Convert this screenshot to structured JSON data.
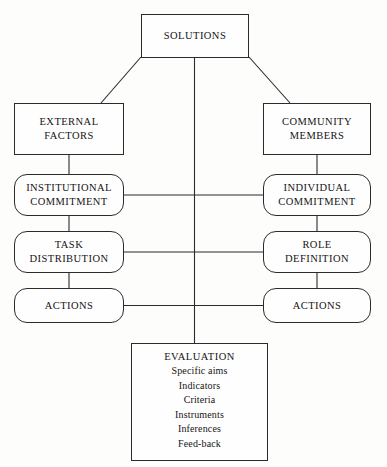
{
  "diagram": {
    "stroke_color": "#2b2b2b",
    "background_color": "#fdfdfc",
    "text_color": "#141414",
    "nodes": {
      "solutions": {
        "shape": "rectangle",
        "lines": [
          "SOLUTIONS"
        ]
      },
      "external_factors": {
        "shape": "rectangle",
        "lines": [
          "EXTERNAL",
          "FACTORS"
        ]
      },
      "community_members": {
        "shape": "rectangle",
        "lines": [
          "COMMUNITY",
          "MEMBERS"
        ]
      },
      "institutional_commitment": {
        "shape": "rounded",
        "lines": [
          "INSTITUTIONAL",
          "COMMITMENT"
        ]
      },
      "individual_commitment": {
        "shape": "rounded",
        "lines": [
          "INDIVIDUAL",
          "COMMITMENT"
        ]
      },
      "task_distribution": {
        "shape": "rounded",
        "lines": [
          "TASK",
          "DISTRIBUTION"
        ]
      },
      "role_definition": {
        "shape": "rounded",
        "lines": [
          "ROLE",
          "DEFINITION"
        ]
      },
      "actions_left": {
        "shape": "rounded",
        "lines": [
          "ACTIONS"
        ]
      },
      "actions_right": {
        "shape": "rounded",
        "lines": [
          "ACTIONS"
        ]
      },
      "evaluation": {
        "shape": "rectangle",
        "title": "EVALUATION",
        "items": [
          "Specific aims",
          "Indicators",
          "Criteria",
          "Instruments",
          "Inferences",
          "Feed-back"
        ]
      }
    }
  }
}
